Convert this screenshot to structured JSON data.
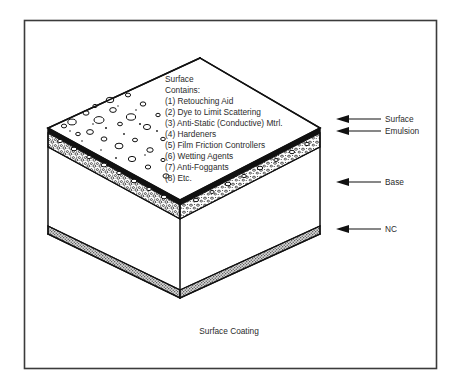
{
  "figure": {
    "caption": "Surface Coating",
    "annotation": {
      "title_line_1": "Surface",
      "title_line_2": "Contains:",
      "items": [
        "(1) Retouching Aid",
        "(2) Dye to Limit Scattering",
        "(3) Anti-Static (Conductive) Mtrl.",
        "(4) Hardeners",
        "(5) Film Friction Controllers",
        "(6) Wetting Agents",
        "(7) Anti-Foggants",
        "(8) Etc."
      ]
    },
    "callouts": [
      {
        "label": "Surface"
      },
      {
        "label": "Emulsion"
      },
      {
        "label": "Base"
      },
      {
        "label": "NC"
      }
    ],
    "colors": {
      "ink": "#111111",
      "text": "#2b2b2b",
      "frame": "#3b3b3b",
      "paper": "#ffffff",
      "nc_fill": "#b9b9b9"
    }
  }
}
